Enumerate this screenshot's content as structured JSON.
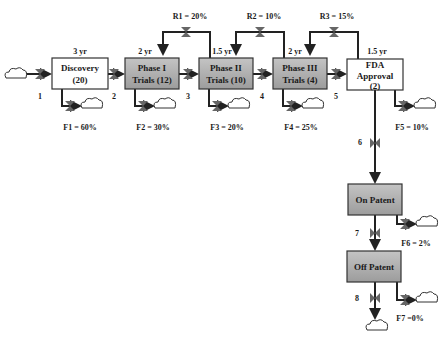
{
  "stocks": [
    {
      "id": "discovery",
      "line1": "Discovery",
      "line2": "(20)",
      "duration": "3 yr",
      "shaded": false
    },
    {
      "id": "phase1",
      "line1": "Phase I",
      "line2": "Trials (12)",
      "duration": "2 yr",
      "shaded": true
    },
    {
      "id": "phase2",
      "line1": "Phase II",
      "line2": "Trials (10)",
      "duration": "1.5 yr",
      "shaded": true
    },
    {
      "id": "phase3",
      "line1": "Phase III",
      "line2": "Trials (4)",
      "duration": "2 yr",
      "shaded": true
    },
    {
      "id": "fda",
      "line1": "FDA",
      "line2": "Approval",
      "line3": "(2)",
      "duration": "1.5 yr",
      "shaded": false
    },
    {
      "id": "onpatent",
      "line1": "On Patent",
      "shaded": true
    },
    {
      "id": "offpatent",
      "line1": "Off Patent",
      "shaded": true
    }
  ],
  "flows": [
    "1",
    "2",
    "3",
    "4",
    "5",
    "6",
    "7",
    "8"
  ],
  "failures": [
    "F1 = 60%",
    "F2 = 30%",
    "F3 = 20%",
    "F4 = 25%",
    "F5 = 10%",
    "F6 = 2%",
    "F7 =0%"
  ],
  "recycles": [
    "R1 = 20%",
    "R2 = 10%",
    "R3 = 15%"
  ],
  "colors": {
    "shaded": "#a9a9a9",
    "white": "#ffffff",
    "line": "#222222"
  }
}
